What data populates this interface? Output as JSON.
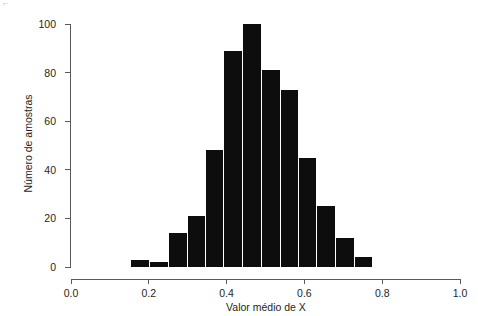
{
  "chart_data": {
    "type": "bar",
    "title": "",
    "subtitle": "",
    "xlabel": "Valor médio de X",
    "ylabel": "Número de amostras",
    "xlim": [
      0.0,
      1.0
    ],
    "ylim": [
      0,
      100
    ],
    "xticks": [
      "0.0",
      "0.2",
      "0.4",
      "0.6",
      "0.8",
      "1.0"
    ],
    "xtick_values": [
      0.0,
      0.2,
      0.4,
      0.6,
      0.8,
      1.0
    ],
    "yticks": [
      "0",
      "20",
      "40",
      "60",
      "80",
      "100"
    ],
    "ytick_values": [
      0,
      20,
      40,
      60,
      80,
      100
    ],
    "grid": false,
    "legend": "none",
    "bar_color": "#0d0d0d",
    "axis_color": "#58595b",
    "bin_width": 0.048,
    "categories": [
      "0.153-0.201",
      "0.201-0.249",
      "0.249-0.297",
      "0.297-0.344",
      "0.344-0.392",
      "0.392-0.440",
      "0.440-0.488",
      "0.488-0.536",
      "0.536-0.584",
      "0.584-0.631",
      "0.631-0.679",
      "0.679-0.727",
      "0.727-0.775",
      "0.775-0.823"
    ],
    "bin_edges": [
      0.153,
      0.201,
      0.249,
      0.297,
      0.344,
      0.392,
      0.44,
      0.488,
      0.536,
      0.584,
      0.631,
      0.679,
      0.727,
      0.775,
      0.823
    ],
    "bin_centers": [
      0.177,
      0.225,
      0.273,
      0.32,
      0.368,
      0.416,
      0.464,
      0.512,
      0.56,
      0.607,
      0.655,
      0.703,
      0.751,
      0.799
    ],
    "values": [
      3,
      2,
      14,
      21,
      48,
      89,
      100,
      81,
      73,
      45,
      25,
      12,
      4,
      0
    ],
    "series": [
      {
        "name": "Número de amostras",
        "values": [
          3,
          2,
          14,
          21,
          48,
          89,
          100,
          81,
          73,
          45,
          25,
          12,
          4,
          0
        ]
      }
    ]
  },
  "figure": {
    "artifact_text": "⌐"
  }
}
